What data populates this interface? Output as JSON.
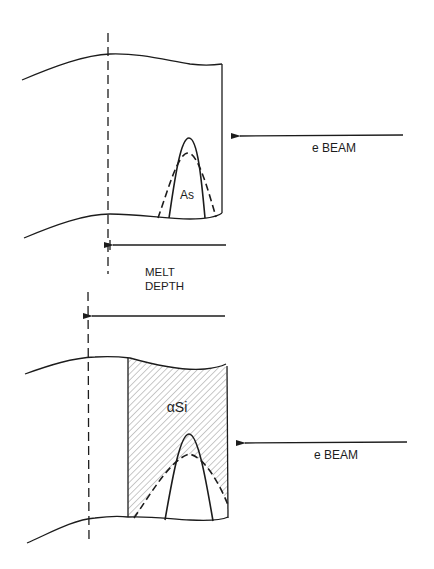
{
  "figure": {
    "colors": {
      "ink": "#1c1c1c",
      "background": "#ffffff",
      "hatch": "#6a6a6a"
    }
  },
  "panels": [
    {
      "id": "top",
      "region_label": "As",
      "beam_label": "e BEAM",
      "depth_label_line1": "MELT",
      "depth_label_line2": "DEPTH"
    },
    {
      "id": "bottom",
      "region_label": "αSi",
      "beam_label": "e BEAM"
    }
  ]
}
